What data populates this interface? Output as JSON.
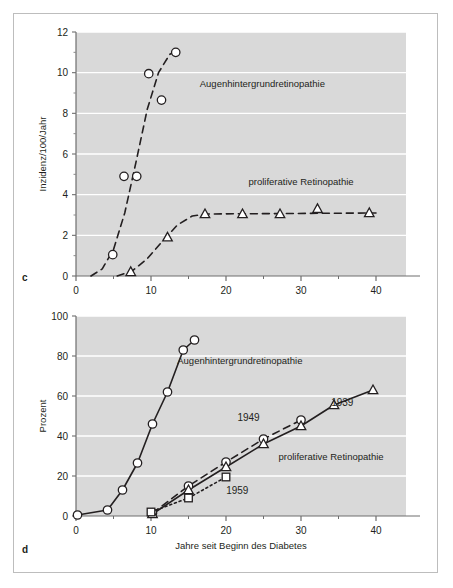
{
  "figure": {
    "background": "#ffffff",
    "border_color": "#bdbdbd",
    "plot_background": "#d9d9d9",
    "gridline_color": "#ffffff",
    "ink_color": "#231f20"
  },
  "panels": [
    {
      "letter": "c"
    },
    {
      "letter": "d"
    }
  ],
  "chart_data": [
    {
      "panel": "c",
      "type": "scatter",
      "title": "",
      "xlabel": "Jahre seit Beginn des Diabetes",
      "ylabel": "Inzidenz/100/Jahr",
      "xlim": [
        0,
        44
      ],
      "ylim": [
        0,
        12
      ],
      "xticks": [
        0,
        10,
        20,
        30,
        40
      ],
      "xtick_labels": [
        "0",
        "10",
        "20",
        "30",
        "40"
      ],
      "xminor_step": 5,
      "yticks": [
        0,
        2,
        4,
        6,
        8,
        10,
        12
      ],
      "ytick_labels": [
        "0",
        "2",
        "4",
        "6",
        "8",
        "10",
        "12"
      ],
      "yminor_step": 1,
      "grid": "horizontal",
      "legend": "inline-annotations",
      "series": [
        {
          "name": "Augenhintergrundretinopathie",
          "marker": "circle",
          "line": "dashed",
          "label_x": 16.5,
          "label_y": 9.3,
          "points": [
            {
              "x": 4.9,
              "y": 1.05
            },
            {
              "x": 6.4,
              "y": 4.9
            },
            {
              "x": 8.1,
              "y": 4.9
            },
            {
              "x": 9.7,
              "y": 9.95
            },
            {
              "x": 11.4,
              "y": 8.65
            },
            {
              "x": 13.3,
              "y": 11.0
            }
          ],
          "fit_curve": [
            {
              "x": 2.0,
              "y": 0.0
            },
            {
              "x": 3.5,
              "y": 0.35
            },
            {
              "x": 5.0,
              "y": 1.3
            },
            {
              "x": 6.5,
              "y": 3.1
            },
            {
              "x": 8.0,
              "y": 5.6
            },
            {
              "x": 9.5,
              "y": 8.2
            },
            {
              "x": 11.0,
              "y": 10.0
            },
            {
              "x": 12.5,
              "y": 10.9
            },
            {
              "x": 13.6,
              "y": 11.1
            }
          ]
        },
        {
          "name": "proliferative Retinopathie",
          "marker": "triangle",
          "line": "dashed",
          "label_x": 23.0,
          "label_y": 4.5,
          "points": [
            {
              "x": 7.3,
              "y": 0.2
            },
            {
              "x": 12.2,
              "y": 1.9
            },
            {
              "x": 17.2,
              "y": 3.05
            },
            {
              "x": 22.2,
              "y": 3.05
            },
            {
              "x": 27.2,
              "y": 3.05
            },
            {
              "x": 32.2,
              "y": 3.3
            },
            {
              "x": 39.1,
              "y": 3.1
            }
          ],
          "fit_curve": [
            {
              "x": 5.5,
              "y": 0.0
            },
            {
              "x": 7.5,
              "y": 0.25
            },
            {
              "x": 9.5,
              "y": 0.85
            },
            {
              "x": 11.5,
              "y": 1.7
            },
            {
              "x": 13.5,
              "y": 2.5
            },
            {
              "x": 15.5,
              "y": 2.95
            },
            {
              "x": 17.5,
              "y": 3.05
            },
            {
              "x": 40.0,
              "y": 3.1
            }
          ]
        }
      ]
    },
    {
      "panel": "d",
      "type": "line",
      "title": "",
      "xlabel": "Jahre seit Beginn des Diabetes",
      "ylabel": "Prozent",
      "xlim": [
        0,
        44
      ],
      "ylim": [
        0,
        100
      ],
      "xticks": [
        0,
        10,
        20,
        30,
        40
      ],
      "xtick_labels": [
        "0",
        "10",
        "20",
        "30",
        "40"
      ],
      "xminor_step": 5,
      "yticks": [
        0,
        20,
        40,
        60,
        80,
        100
      ],
      "ytick_labels": [
        "0",
        "20",
        "40",
        "60",
        "80",
        "100"
      ],
      "grid": "horizontal",
      "legend": "inline-annotations",
      "series": [
        {
          "name": "Augenhintergrundretinopathie",
          "marker": "circle",
          "line": "solid",
          "label_x": 13.5,
          "label_y": 76.0,
          "points": [
            {
              "x": 0.2,
              "y": 0.5
            },
            {
              "x": 4.2,
              "y": 3.0
            },
            {
              "x": 6.2,
              "y": 13.0
            },
            {
              "x": 8.2,
              "y": 26.5
            },
            {
              "x": 10.2,
              "y": 46.0
            },
            {
              "x": 12.2,
              "y": 62.0
            },
            {
              "x": 14.3,
              "y": 83.0
            },
            {
              "x": 15.8,
              "y": 88.0
            }
          ]
        },
        {
          "name": "1949",
          "marker": "circle",
          "line": "dashed",
          "label_x": 23.0,
          "label_y": 47.5,
          "points": [
            {
              "x": 10.2,
              "y": 1.5
            },
            {
              "x": 15.0,
              "y": 15.0
            },
            {
              "x": 20.0,
              "y": 27.0
            },
            {
              "x": 25.0,
              "y": 38.5
            },
            {
              "x": 30.0,
              "y": 48.0
            }
          ]
        },
        {
          "name": "1939",
          "marker": "triangle",
          "line": "solid",
          "label_x": 35.5,
          "label_y": 55.0,
          "points": [
            {
              "x": 10.2,
              "y": 1.0
            },
            {
              "x": 15.0,
              "y": 13.0
            },
            {
              "x": 20.0,
              "y": 24.5
            },
            {
              "x": 25.0,
              "y": 36.0
            },
            {
              "x": 30.0,
              "y": 45.0
            },
            {
              "x": 34.4,
              "y": 55.5
            },
            {
              "x": 39.6,
              "y": 63.0
            }
          ]
        },
        {
          "name": "1959",
          "marker": "square",
          "line": "dotted",
          "label_x": 21.5,
          "label_y": 11.0,
          "points": [
            {
              "x": 10.0,
              "y": 2.0
            },
            {
              "x": 15.0,
              "y": 9.0
            },
            {
              "x": 20.0,
              "y": 19.5
            }
          ]
        },
        {
          "name": "proliferative Retinopathie",
          "marker": "none",
          "line": "none",
          "label_x": 27.0,
          "label_y": 28.0,
          "points": []
        }
      ]
    }
  ]
}
